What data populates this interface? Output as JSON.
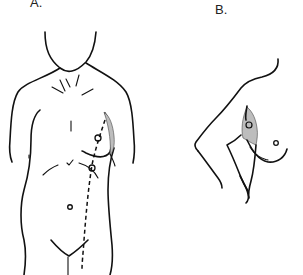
{
  "figure": {
    "panels": [
      {
        "id": "A",
        "label": "A.",
        "description": "Frontal torso with dashed incision line and marked points"
      },
      {
        "id": "B",
        "label": "B.",
        "description": "Lateral view with raised arm and shaded region"
      }
    ]
  }
}
